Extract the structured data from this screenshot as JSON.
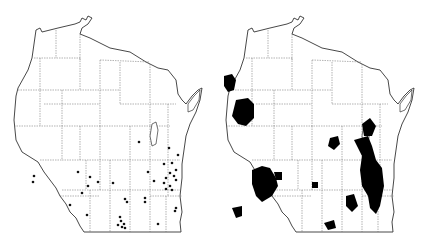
{
  "figure": {
    "maps": [
      {
        "id": "left",
        "style": "point occurrences",
        "dots": [
          [
            34,
            176
          ],
          [
            33,
            182
          ],
          [
            139,
            142
          ],
          [
            169,
            127
          ],
          [
            168,
            147
          ],
          [
            172,
            143
          ],
          [
            170,
            153
          ],
          [
            163,
            152
          ],
          [
            162,
            160
          ],
          [
            165,
            159
          ],
          [
            178,
            166
          ],
          [
            176,
            162
          ],
          [
            172,
            161
          ],
          [
            166,
            170
          ],
          [
            162,
            173
          ],
          [
            168,
            172
          ],
          [
            171,
            182
          ],
          [
            178,
            171
          ],
          [
            175,
            178
          ],
          [
            148,
            173
          ],
          [
            153,
            180
          ],
          [
            173,
            186
          ],
          [
            177,
            190
          ],
          [
            176,
            209
          ],
          [
            146,
            199
          ],
          [
            145,
            201
          ],
          [
            145,
            200
          ],
          [
            125,
            200
          ],
          [
            127,
            201
          ],
          [
            144,
            199
          ],
          [
            120,
            210
          ],
          [
            118,
            221
          ],
          [
            121,
            224
          ],
          [
            124,
            226
          ],
          [
            122,
            229
          ],
          [
            126,
            226
          ],
          [
            116,
            226
          ],
          [
            158,
            224
          ],
          [
            87,
            215
          ],
          [
            69,
            183
          ],
          [
            79,
            184
          ],
          [
            88,
            181
          ],
          [
            90,
            177
          ],
          [
            98,
            182
          ],
          [
            82,
            192
          ],
          [
            112,
            184
          ],
          [
            77,
            172
          ]
        ],
        "dot_color": "#111111"
      },
      {
        "id": "right",
        "style": "filled ranges",
        "fill_color": "#000000"
      }
    ]
  }
}
